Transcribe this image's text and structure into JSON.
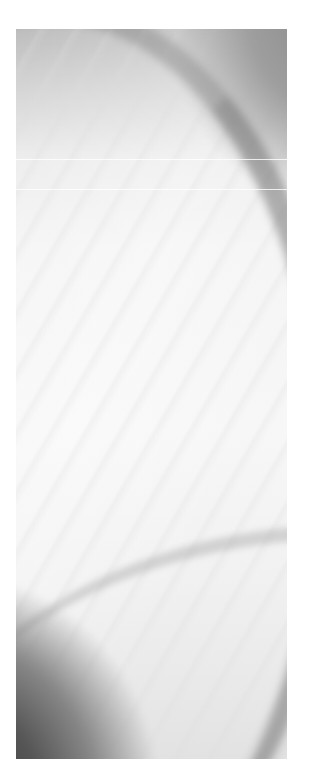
{
  "artwork": {
    "description": "Abstract grayscale painting with curved dark sweeps at top-right and bottom-left corners",
    "colors": {
      "background": "#ffffff",
      "light": "#f6f6f6",
      "mid": "#bdbdbd",
      "dark": "#3a3a3a"
    }
  }
}
